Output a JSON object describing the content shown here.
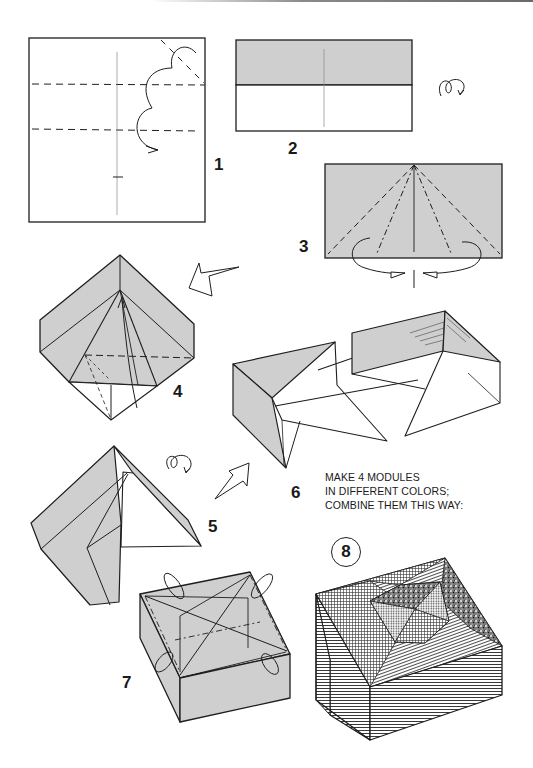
{
  "page": {
    "type": "origami instruction diagram",
    "colors": {
      "paper_gray": "#cfcfcf",
      "line": "#1e1e1e",
      "background": "#ffffff"
    }
  },
  "steps": [
    {
      "number": "1",
      "description": "Square sheet; valley-fold bottom and top edges to horizontal creases",
      "icons": [
        "valley-fold-line",
        "fold-arrow"
      ]
    },
    {
      "number": "2",
      "description": "Rectangle with colored top half and vertical center crease",
      "icons": [
        "turn-over-icon"
      ]
    },
    {
      "number": "3",
      "description": "Colored rectangle with radiating dashed/dash-dot fold lines from top center; fold corners behind",
      "icons": [
        "fold-behind-arrow"
      ]
    },
    {
      "number": "4",
      "description": "Diamond-shaped folded module with inner pyramid",
      "icons": [
        "hollow-arrow-left"
      ]
    },
    {
      "number": "5",
      "description": "Triangular module shape",
      "icons": [
        "turn-over-icon",
        "hollow-arrow-up-right"
      ]
    },
    {
      "number": "6",
      "description": "Two modules being combined, connection lines shown"
    },
    {
      "number": "7",
      "description": "Assembled box with fold-in arrows on the top"
    },
    {
      "number": "8",
      "description": "Finished box with four differently patterned modules",
      "circled": true
    }
  ],
  "note": {
    "lines": [
      "MAKE 4 MODULES",
      "IN DIFFERENT COLORS;",
      "COMBINE THEM THIS WAY:"
    ]
  }
}
